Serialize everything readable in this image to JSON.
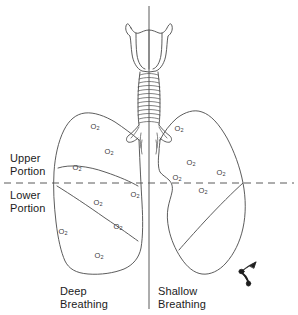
{
  "figure": {
    "width": 298,
    "height": 315,
    "background_color": "#ffffff",
    "line_color": "#4a4a4a",
    "text_color": "#1b1b1b"
  },
  "labels": {
    "upper_portion": "Upper\nPortion",
    "lower_portion": "Lower\nPortion",
    "deep_breathing": "Deep\nBreathing",
    "shallow_breathing": "Shallow\nBreathing"
  },
  "divider": {
    "vertical_x": 149,
    "horizontal_dashed_y": 183,
    "dash_pattern": "7 5",
    "color": "#5a5a5a"
  },
  "anatomy": {
    "larynx": "larynx",
    "trachea": "trachea",
    "trachea_rings": 17,
    "bronchi": "primary-bronchi",
    "left_lung": "deep-breathing-lung",
    "right_lung": "shallow-breathing-lung",
    "fissures": 3,
    "pointer_marker": "bottom-right-pointer"
  },
  "oxygen_marker": {
    "symbol": "O",
    "subscript": "2",
    "color": "#3a3a3a"
  },
  "oxygen_markers": {
    "deep_breathing_side": [
      {
        "x": 95,
        "y": 127,
        "label": "O2"
      },
      {
        "x": 109,
        "y": 152,
        "label": "O2"
      },
      {
        "x": 77,
        "y": 168,
        "label": "O2"
      },
      {
        "x": 135,
        "y": 195,
        "label": "O2"
      },
      {
        "x": 98,
        "y": 203,
        "label": "O2"
      },
      {
        "x": 118,
        "y": 227,
        "label": "O2"
      },
      {
        "x": 63,
        "y": 232,
        "label": "O2"
      },
      {
        "x": 99,
        "y": 256,
        "label": "O2"
      }
    ],
    "shallow_breathing_side": [
      {
        "x": 179,
        "y": 129,
        "label": "O2"
      },
      {
        "x": 191,
        "y": 163,
        "label": "O2"
      },
      {
        "x": 221,
        "y": 173,
        "label": "O2"
      },
      {
        "x": 177,
        "y": 178,
        "label": "O2"
      },
      {
        "x": 203,
        "y": 191,
        "label": "O2"
      }
    ]
  },
  "counts": {
    "deep_breathing_markers": 8,
    "shallow_breathing_markers": 5
  }
}
